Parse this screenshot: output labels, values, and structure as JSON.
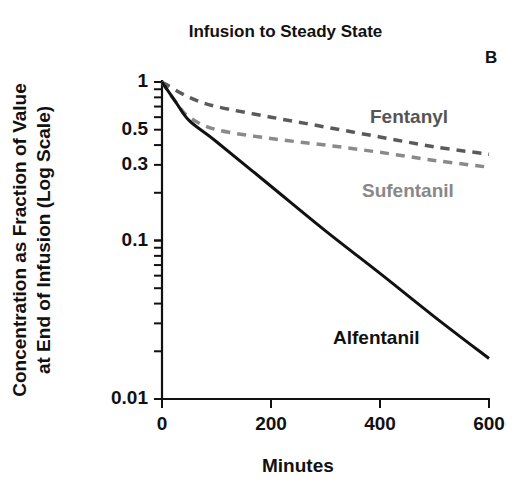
{
  "chart_data": {
    "type": "line",
    "title": "Infusion to Steady State",
    "panel_label": "B",
    "xlabel": "Minutes",
    "ylabel": [
      "Concentration as Fraction of Value",
      "at End of Infusion (Log Scale)"
    ],
    "xscale": "linear",
    "yscale": "log",
    "xlim": [
      0,
      600
    ],
    "ylim": [
      0.01,
      1
    ],
    "x_ticks": [
      0,
      200,
      400,
      600
    ],
    "x_tick_labels": [
      "0",
      "200",
      "400",
      "600"
    ],
    "y_ticks": [
      1,
      0.5,
      0.3,
      0.1,
      0.01
    ],
    "y_tick_labels": [
      "1",
      "0.5",
      "0.3",
      "0.1",
      "0.01"
    ],
    "grid": false,
    "legend": "inline labels",
    "series": [
      {
        "name": "Fentanyl",
        "style": "dashed",
        "color": "#5a5a5a",
        "x": [
          0,
          50,
          100,
          200,
          300,
          400,
          500,
          600
        ],
        "values": [
          1.0,
          0.8,
          0.7,
          0.6,
          0.52,
          0.45,
          0.39,
          0.35
        ]
      },
      {
        "name": "Sufentanil",
        "style": "dashed",
        "color": "#8a8a8a",
        "x": [
          0,
          25,
          50,
          100,
          200,
          300,
          400,
          500,
          600
        ],
        "values": [
          1.0,
          0.75,
          0.6,
          0.5,
          0.44,
          0.4,
          0.36,
          0.32,
          0.29
        ]
      },
      {
        "name": "Alfentanil",
        "style": "solid",
        "color": "#111111",
        "x": [
          0,
          25,
          50,
          100,
          200,
          300,
          400,
          500,
          600
        ],
        "values": [
          1.0,
          0.75,
          0.57,
          0.42,
          0.22,
          0.115,
          0.062,
          0.033,
          0.018
        ]
      }
    ]
  }
}
